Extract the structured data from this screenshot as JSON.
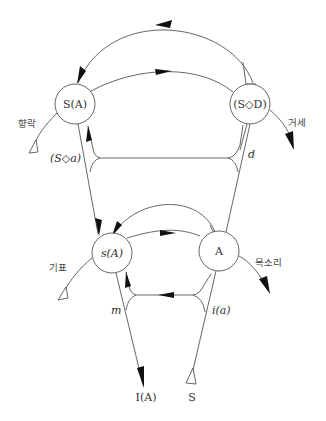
{
  "diagram": {
    "nodes": {
      "big_s_barred_a": "S(A)",
      "s_lozenge_d": "(S◇D)",
      "small_s_a": "s(A)",
      "big_a": "A"
    },
    "edge_labels": {
      "s_lozenge_a": "(S◇a)",
      "d": "d",
      "m": "m",
      "i_a": "i(a)"
    },
    "endpoints": {
      "i_a_bottom": "I(A)",
      "s_bottom": "S"
    },
    "korean_labels": {
      "jouissance": "향락",
      "castration": "거세",
      "signifier": "기표",
      "voice": "목소리"
    },
    "colors": {
      "line": "#555555",
      "arrow": "#111111",
      "text": "#333333",
      "background": "#ffffff"
    }
  }
}
